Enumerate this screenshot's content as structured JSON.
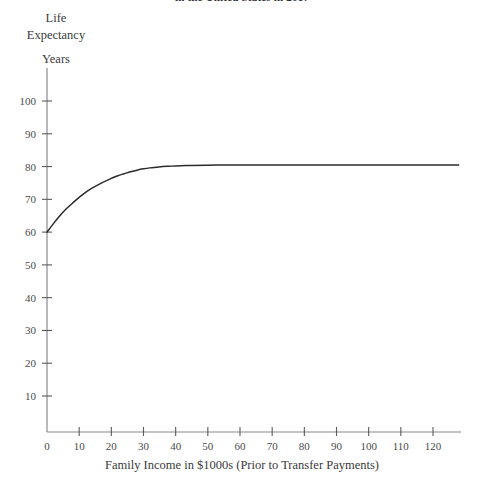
{
  "chart_data": {
    "type": "line",
    "title": "in the United States in 2017",
    "xlabel": "Family Income in $1000s (Prior to Transfer Payments)",
    "ylabel": "Life Expectancy",
    "yunits": "Years",
    "xlim": [
      0,
      130
    ],
    "ylim": [
      0,
      105
    ],
    "xticks": [
      0,
      10,
      20,
      30,
      40,
      50,
      60,
      70,
      80,
      90,
      100,
      110,
      120
    ],
    "yticks": [
      10,
      20,
      30,
      40,
      50,
      60,
      70,
      80,
      90,
      100
    ],
    "grid": false,
    "legend": false,
    "series": [
      {
        "name": "Life Expectancy",
        "color": "#2b2b2b",
        "x": [
          0,
          2,
          4,
          6,
          8,
          10,
          12,
          14,
          16,
          18,
          20,
          22,
          24,
          26,
          28,
          30,
          32,
          34,
          36,
          38,
          40,
          45,
          50,
          55,
          60,
          65,
          70,
          75,
          80,
          85,
          90,
          95,
          100,
          105,
          110,
          115,
          120,
          125,
          128
        ],
        "values": [
          60.0,
          62.6,
          65.0,
          67.1,
          68.9,
          70.6,
          72.1,
          73.4,
          74.5,
          75.5,
          76.4,
          77.2,
          77.8,
          78.4,
          78.9,
          79.3,
          79.6,
          79.8,
          80.0,
          80.1,
          80.2,
          80.35,
          80.42,
          80.46,
          80.48,
          80.49,
          80.5,
          80.5,
          80.5,
          80.5,
          80.5,
          80.5,
          80.5,
          80.5,
          80.5,
          80.5,
          80.5,
          80.5,
          80.5
        ]
      }
    ],
    "asymptote": 80.5,
    "start_value": 60.0
  },
  "labels": {
    "y_caption_line1": "Life",
    "y_caption_line2": "Expectancy",
    "y_units": "Years",
    "x_caption": "Family Income in $1000s (Prior to Transfer Payments)",
    "title": "in the United States in 2017"
  },
  "colors": {
    "background": "#ffffff",
    "axis": "#8a8a8a",
    "curve": "#2b2b2b",
    "text": "#3a3a3a"
  }
}
